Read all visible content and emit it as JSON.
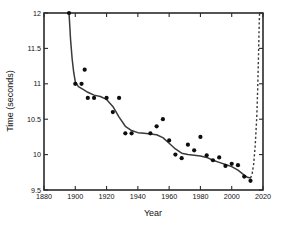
{
  "chart_data": {
    "type": "scatter",
    "title": "",
    "xlabel": "Year",
    "ylabel": "Time (seconds)",
    "xlim": [
      1880,
      2020
    ],
    "ylim": [
      9.5,
      12.0
    ],
    "xticks": [
      1880,
      1900,
      1920,
      1940,
      1960,
      1980,
      2000,
      2020
    ],
    "yticks": [
      9.5,
      10,
      10.5,
      11,
      11.5,
      12
    ],
    "xtick_labels": [
      "1880",
      "1900",
      "1920",
      "1940",
      "1960",
      "1980",
      "2000",
      "2020"
    ],
    "ytick_labels": [
      "9.5",
      "10",
      "10.5",
      "11",
      "11.5",
      "12"
    ],
    "grid": false,
    "legend": null,
    "marker": "filled-circle",
    "marker_color": "#0d0d0d",
    "line_color": "#3a3a3a",
    "points": [
      {
        "x": 1896,
        "y": 12.0
      },
      {
        "x": 1900,
        "y": 11.0
      },
      {
        "x": 1904,
        "y": 11.0
      },
      {
        "x": 1906,
        "y": 11.2
      },
      {
        "x": 1908,
        "y": 10.8
      },
      {
        "x": 1912,
        "y": 10.8
      },
      {
        "x": 1920,
        "y": 10.8
      },
      {
        "x": 1924,
        "y": 10.6
      },
      {
        "x": 1928,
        "y": 10.8
      },
      {
        "x": 1932,
        "y": 10.3
      },
      {
        "x": 1936,
        "y": 10.3
      },
      {
        "x": 1948,
        "y": 10.3
      },
      {
        "x": 1952,
        "y": 10.4
      },
      {
        "x": 1956,
        "y": 10.5
      },
      {
        "x": 1960,
        "y": 10.2
      },
      {
        "x": 1964,
        "y": 10.0
      },
      {
        "x": 1968,
        "y": 9.95
      },
      {
        "x": 1972,
        "y": 10.14
      },
      {
        "x": 1976,
        "y": 10.06
      },
      {
        "x": 1980,
        "y": 10.25
      },
      {
        "x": 1984,
        "y": 9.99
      },
      {
        "x": 1988,
        "y": 9.92
      },
      {
        "x": 1992,
        "y": 9.96
      },
      {
        "x": 1996,
        "y": 9.84
      },
      {
        "x": 2000,
        "y": 9.87
      },
      {
        "x": 2004,
        "y": 9.85
      },
      {
        "x": 2008,
        "y": 9.69
      },
      {
        "x": 2012,
        "y": 9.63
      }
    ],
    "fit_curve": {
      "name": "smoothed-trend",
      "style": "solid",
      "points": [
        {
          "x": 1896,
          "y": 12.0
        },
        {
          "x": 1897,
          "y": 11.62
        },
        {
          "x": 1898,
          "y": 11.35
        },
        {
          "x": 1899,
          "y": 11.16
        },
        {
          "x": 1900,
          "y": 11.03
        },
        {
          "x": 1902,
          "y": 10.96
        },
        {
          "x": 1905,
          "y": 10.92
        },
        {
          "x": 1908,
          "y": 10.88
        },
        {
          "x": 1912,
          "y": 10.84
        },
        {
          "x": 1916,
          "y": 10.82
        },
        {
          "x": 1920,
          "y": 10.78
        },
        {
          "x": 1924,
          "y": 10.68
        },
        {
          "x": 1928,
          "y": 10.53
        },
        {
          "x": 1932,
          "y": 10.4
        },
        {
          "x": 1936,
          "y": 10.34
        },
        {
          "x": 1940,
          "y": 10.31
        },
        {
          "x": 1944,
          "y": 10.3
        },
        {
          "x": 1948,
          "y": 10.29
        },
        {
          "x": 1952,
          "y": 10.28
        },
        {
          "x": 1956,
          "y": 10.24
        },
        {
          "x": 1960,
          "y": 10.16
        },
        {
          "x": 1964,
          "y": 10.08
        },
        {
          "x": 1968,
          "y": 10.02
        },
        {
          "x": 1972,
          "y": 10.0
        },
        {
          "x": 1976,
          "y": 9.99
        },
        {
          "x": 1980,
          "y": 9.98
        },
        {
          "x": 1984,
          "y": 9.96
        },
        {
          "x": 1988,
          "y": 9.92
        },
        {
          "x": 1992,
          "y": 9.89
        },
        {
          "x": 1996,
          "y": 9.86
        },
        {
          "x": 2000,
          "y": 9.83
        },
        {
          "x": 2004,
          "y": 9.78
        },
        {
          "x": 2008,
          "y": 9.71
        },
        {
          "x": 2010,
          "y": 9.68
        },
        {
          "x": 2012,
          "y": 9.67
        }
      ]
    },
    "projection_curve": {
      "name": "extrapolation",
      "style": "dashed",
      "points": [
        {
          "x": 2012,
          "y": 9.67
        },
        {
          "x": 2013,
          "y": 9.72
        },
        {
          "x": 2014,
          "y": 9.86
        },
        {
          "x": 2015,
          "y": 10.12
        },
        {
          "x": 2016,
          "y": 10.52
        },
        {
          "x": 2016.6,
          "y": 10.92
        },
        {
          "x": 2017.1,
          "y": 11.36
        },
        {
          "x": 2017.5,
          "y": 11.78
        },
        {
          "x": 2017.8,
          "y": 12.0
        }
      ]
    }
  }
}
